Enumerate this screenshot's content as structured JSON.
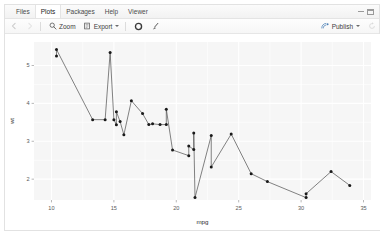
{
  "window": {
    "minimize_label": "minimize",
    "maximize_label": "maximize"
  },
  "tabs": [
    {
      "id": "files",
      "label": "Files",
      "active": false
    },
    {
      "id": "plots",
      "label": "Plots",
      "active": true
    },
    {
      "id": "packages",
      "label": "Packages",
      "active": false
    },
    {
      "id": "help",
      "label": "Help",
      "active": false
    },
    {
      "id": "viewer",
      "label": "Viewer",
      "active": false
    }
  ],
  "toolbar": {
    "back_icon": "back-arrow-icon",
    "forward_icon": "forward-arrow-icon",
    "zoom_label": "Zoom",
    "zoom_icon": "magnifier-icon",
    "export_label": "Export",
    "export_icon": "export-icon",
    "export_caret": "chevron-down-icon",
    "remove_label": "Remove current plot",
    "remove_icon": "remove-circle-icon",
    "clear_label": "Clear all plots",
    "clear_icon": "broom-icon",
    "publish_label": "Publish",
    "publish_icon": "publish-icon",
    "publish_caret": "chevron-down-icon",
    "refresh_icon": "refresh-icon"
  },
  "chart_data": {
    "type": "line",
    "title": "",
    "xlabel": "mpg",
    "ylabel": "wt",
    "xlim": [
      8.6,
      35.6
    ],
    "ylim": [
      1.45,
      5.62
    ],
    "xticks": [
      10,
      15,
      20,
      25,
      30,
      35
    ],
    "yticks": [
      2,
      3,
      4,
      5
    ],
    "xtick_labels": [
      "10",
      "15",
      "20",
      "25",
      "30",
      "35"
    ],
    "ytick_labels": [
      "2",
      "3",
      "4",
      "5"
    ],
    "grid": true,
    "legend": "none",
    "point_color": "#1a1a1a",
    "line_color": "#4d4d4d",
    "panel_background": "#f6f6f6",
    "grid_color": "#ffffff",
    "series": [
      {
        "name": "wt",
        "x": [
          10.4,
          10.4,
          13.3,
          14.3,
          14.7,
          15.0,
          15.2,
          15.2,
          15.5,
          15.8,
          16.4,
          17.3,
          17.8,
          18.1,
          18.7,
          19.2,
          19.2,
          19.7,
          21.0,
          21.0,
          21.4,
          21.4,
          21.5,
          22.8,
          22.8,
          24.4,
          26.0,
          27.3,
          30.4,
          30.4,
          32.4,
          33.9
        ],
        "y": [
          5.25,
          5.424,
          3.57,
          3.57,
          5.345,
          3.57,
          3.435,
          3.78,
          3.52,
          3.17,
          4.07,
          3.73,
          3.44,
          3.46,
          3.44,
          3.44,
          3.845,
          2.77,
          2.62,
          2.875,
          2.78,
          3.215,
          1.513,
          3.15,
          2.32,
          3.19,
          2.144,
          1.935,
          1.513,
          1.615,
          2.2,
          1.835
        ]
      }
    ]
  }
}
